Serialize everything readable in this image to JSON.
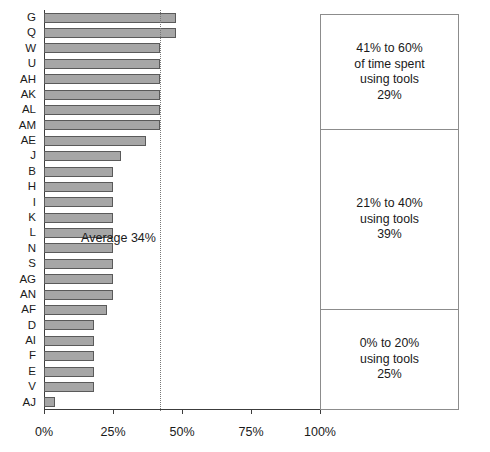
{
  "chart_data": {
    "type": "bar",
    "orientation": "horizontal",
    "title": "",
    "xlabel": "",
    "ylabel": "",
    "xlim": [
      0,
      100
    ],
    "xticks": [
      "0%",
      "25%",
      "50%",
      "75%",
      "100%"
    ],
    "xtick_values": [
      0,
      25,
      50,
      75,
      100
    ],
    "grid": false,
    "legend": "none",
    "categories": [
      "G",
      "Q",
      "W",
      "U",
      "AH",
      "AK",
      "AL",
      "AM",
      "AE",
      "J",
      "B",
      "H",
      "I",
      "K",
      "L",
      "N",
      "S",
      "AG",
      "AN",
      "AF",
      "D",
      "AI",
      "F",
      "E",
      "V",
      "AJ"
    ],
    "values": [
      48,
      48,
      42,
      42,
      42,
      42,
      42,
      42,
      37,
      28,
      25,
      25,
      25,
      25,
      25,
      25,
      25,
      25,
      25,
      23,
      18,
      18,
      18,
      18,
      18,
      4
    ],
    "series": [
      {
        "name": "Percent of time spent using tools",
        "values": [
          48,
          48,
          42,
          42,
          42,
          42,
          42,
          42,
          37,
          28,
          25,
          25,
          25,
          25,
          25,
          25,
          25,
          25,
          25,
          23,
          18,
          18,
          18,
          18,
          18,
          4
        ]
      }
    ],
    "annotations": [
      {
        "name": "average-line",
        "label": "Average 34%",
        "value": 42,
        "style": "dotted-vertical-line"
      }
    ],
    "side_boxes": [
      {
        "range_label": "41% to 60%",
        "detail_label": "of time spent",
        "sub_label": "using tools",
        "percent": "29%",
        "text": "41% to 60%\nof time spent\nusing tools\n29%"
      },
      {
        "range_label": "21% to 40%",
        "detail_label": "",
        "sub_label": "using tools",
        "percent": "39%",
        "text": "21% to 40%\nusing tools\n39%"
      },
      {
        "range_label": "0% to 20%",
        "detail_label": "",
        "sub_label": "using tools",
        "percent": "25%",
        "text": "0% to 20%\nusing tools\n25%"
      }
    ],
    "colors": {
      "bar_fill": "#a6a6a6",
      "bar_border": "#5a5a5a",
      "axis": "#3c3c3c",
      "average_line": "#777777",
      "box_border": "#8c8c8c",
      "text": "#1a1a1a",
      "background": "#ffffff"
    }
  }
}
